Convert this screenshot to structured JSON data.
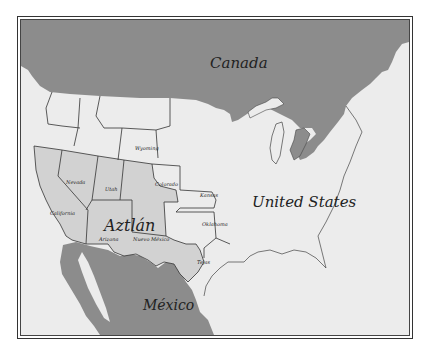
{
  "map": {
    "title_regions": {
      "canada": "Canada",
      "united_states": "United States",
      "mexico": "México",
      "aztlan": "Aztlán"
    },
    "states": [
      {
        "id": "california",
        "label": "California"
      },
      {
        "id": "nevada",
        "label": "Nevada"
      },
      {
        "id": "utah",
        "label": "Utah"
      },
      {
        "id": "arizona",
        "label": "Arizona"
      },
      {
        "id": "nuevo-mexico",
        "label": "Nuevo México"
      },
      {
        "id": "colorado",
        "label": "Colorado"
      },
      {
        "id": "wyoming",
        "label": "Wyoming"
      },
      {
        "id": "kansas",
        "label": "Kansas"
      },
      {
        "id": "oklahoma",
        "label": "Oklahoma"
      },
      {
        "id": "tejas",
        "label": "Tejas"
      }
    ],
    "colors": {
      "foreign_land": "#8a8a8a",
      "aztlan": "#d2d2d2",
      "us_land": "#ededed",
      "border": "#333333",
      "background": "#ffffff"
    }
  }
}
